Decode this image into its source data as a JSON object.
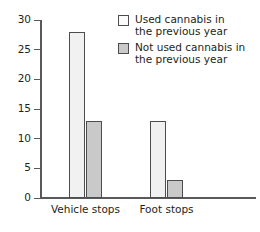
{
  "figure": {
    "clipped_caption": "",
    "background": "#ffffff"
  },
  "chart_data": {
    "type": "bar",
    "title": "",
    "xlabel": "",
    "ylabel": "",
    "categories": [
      "Vehicle stops",
      "Foot stops"
    ],
    "series": [
      {
        "name": "Used cannabis in the previous year",
        "values": [
          28,
          13
        ],
        "color": "#f1f1f1",
        "edge_color": "#4c4d4f"
      },
      {
        "name": "Not used cannabis in the previous year",
        "values": [
          13,
          3
        ],
        "color": "#c9c9c9",
        "edge_color": "#4c4d4f"
      }
    ],
    "ylim": [
      0,
      30
    ],
    "yticks": [
      0,
      5,
      10,
      15,
      20,
      25,
      30
    ],
    "ytick_labels": [
      "0",
      "5",
      "10",
      "15",
      "20",
      "25",
      "30"
    ],
    "grid": false,
    "legend_position": "upper right",
    "legend_entries": [
      "Used cannabis in\nthe previous year",
      "Not used cannabis in\nthe previous year"
    ]
  },
  "axes": {
    "y_ticks": [
      {
        "label": "30",
        "value": 30
      },
      {
        "label": "25",
        "value": 25
      },
      {
        "label": "20",
        "value": 20
      },
      {
        "label": "15",
        "value": 15
      },
      {
        "label": "10",
        "value": 10
      },
      {
        "label": "5",
        "value": 5
      },
      {
        "label": "0",
        "value": 0
      }
    ],
    "x_categories": [
      {
        "label": "Vehicle stops"
      },
      {
        "label": "Foot stops"
      }
    ]
  },
  "legend": {
    "items": [
      {
        "label": "Used cannabis in\nthe previous year",
        "swatch": "light"
      },
      {
        "label": "Not used cannabis in\nthe previous year",
        "swatch": "dark"
      }
    ]
  },
  "bars": [
    {
      "group": "Vehicle stops",
      "series": "Used cannabis in the previous year",
      "value": 28,
      "style": "light",
      "left": 69,
      "width": 16
    },
    {
      "group": "Vehicle stops",
      "series": "Not used cannabis in the previous year",
      "value": 13,
      "style": "dark",
      "left": 86,
      "width": 16
    },
    {
      "group": "Foot stops",
      "series": "Used cannabis in the previous year",
      "value": 13,
      "style": "light",
      "left": 150,
      "width": 16
    },
    {
      "group": "Foot stops",
      "series": "Not used cannabis in the previous year",
      "value": 3,
      "style": "dark",
      "left": 167,
      "width": 16
    }
  ]
}
